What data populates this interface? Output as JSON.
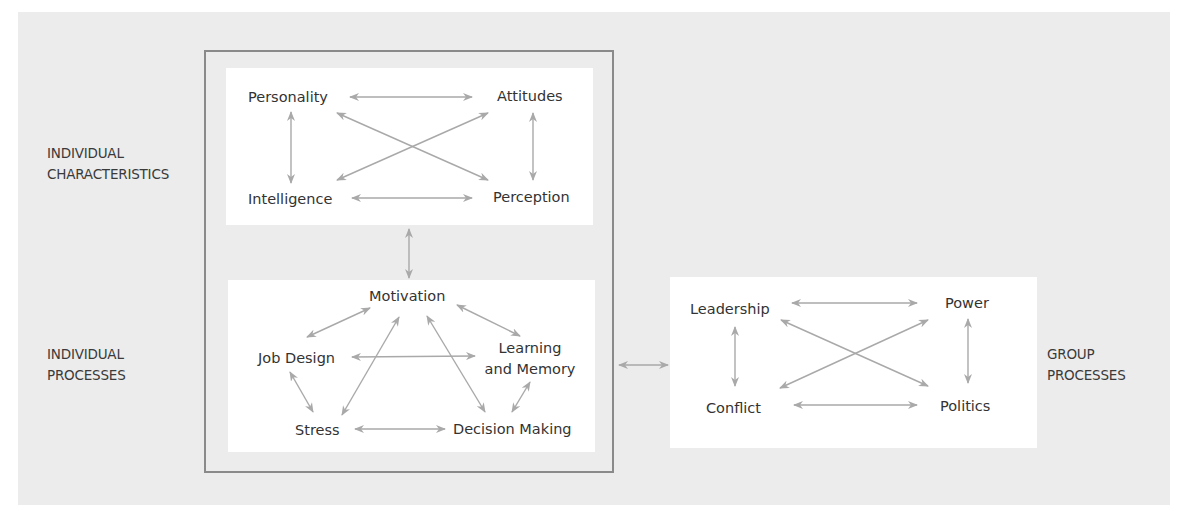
{
  "diagram": {
    "colors": {
      "background": "#ececec",
      "box_fill": "#ffffff",
      "frame_stroke": "#8a8a8a",
      "arrow": "#a9a9a9",
      "text": "#333333"
    },
    "side_labels": {
      "individual_characteristics": [
        "INDIVIDUAL",
        "CHARACTERISTICS"
      ],
      "individual_processes": [
        "INDIVIDUAL",
        "PROCESSES"
      ],
      "group_processes": [
        "GROUP",
        "PROCESSES"
      ]
    },
    "individual_characteristics": {
      "nodes": {
        "personality": "Personality",
        "attitudes": "Attitudes",
        "intelligence": "Intelligence",
        "perception": "Perception"
      }
    },
    "individual_processes": {
      "nodes": {
        "motivation": "Motivation",
        "job_design": "Job Design",
        "learning_memory": [
          "Learning",
          "and Memory"
        ],
        "stress": "Stress",
        "decision_making": "Decision Making"
      }
    },
    "group_processes": {
      "nodes": {
        "leadership": "Leadership",
        "power": "Power",
        "conflict": "Conflict",
        "politics": "Politics"
      }
    },
    "edges": [
      {
        "from": "Personality",
        "to": "Attitudes",
        "type": "bidirectional"
      },
      {
        "from": "Personality",
        "to": "Intelligence",
        "type": "bidirectional"
      },
      {
        "from": "Personality",
        "to": "Perception",
        "type": "bidirectional"
      },
      {
        "from": "Intelligence",
        "to": "Attitudes",
        "type": "bidirectional"
      },
      {
        "from": "Intelligence",
        "to": "Perception",
        "type": "bidirectional"
      },
      {
        "from": "Attitudes",
        "to": "Perception",
        "type": "bidirectional"
      },
      {
        "from": "Individual Characteristics",
        "to": "Individual Processes",
        "type": "bidirectional"
      },
      {
        "from": "Motivation",
        "to": "Job Design",
        "type": "bidirectional"
      },
      {
        "from": "Motivation",
        "to": "Learning and Memory",
        "type": "bidirectional"
      },
      {
        "from": "Motivation",
        "to": "Stress",
        "type": "bidirectional"
      },
      {
        "from": "Motivation",
        "to": "Decision Making",
        "type": "bidirectional"
      },
      {
        "from": "Job Design",
        "to": "Learning and Memory",
        "type": "bidirectional"
      },
      {
        "from": "Job Design",
        "to": "Stress",
        "type": "bidirectional"
      },
      {
        "from": "Stress",
        "to": "Decision Making",
        "type": "bidirectional"
      },
      {
        "from": "Learning and Memory",
        "to": "Decision Making",
        "type": "bidirectional"
      },
      {
        "from": "Individual",
        "to": "Group Processes",
        "type": "bidirectional"
      },
      {
        "from": "Leadership",
        "to": "Power",
        "type": "bidirectional"
      },
      {
        "from": "Leadership",
        "to": "Conflict",
        "type": "bidirectional"
      },
      {
        "from": "Leadership",
        "to": "Politics",
        "type": "bidirectional"
      },
      {
        "from": "Conflict",
        "to": "Power",
        "type": "bidirectional"
      },
      {
        "from": "Conflict",
        "to": "Politics",
        "type": "bidirectional"
      },
      {
        "from": "Power",
        "to": "Politics",
        "type": "bidirectional"
      }
    ]
  }
}
